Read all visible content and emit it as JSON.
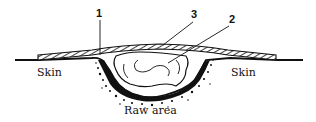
{
  "diagram": {
    "callouts": [
      {
        "id": "1",
        "label": "1"
      },
      {
        "id": "3",
        "label": "3"
      },
      {
        "id": "2",
        "label": "2"
      }
    ],
    "labels": {
      "skin_left": "Skin",
      "skin_right": "Skin",
      "raw_area": "Raw area"
    },
    "colors": {
      "ink": "#111111",
      "background": "#ffffff"
    }
  }
}
